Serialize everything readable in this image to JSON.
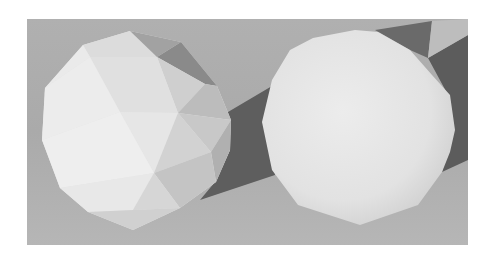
{
  "figure": {
    "left_object": "flat-shaded-sphere",
    "right_object": "smooth-shaded-sphere",
    "colors": {
      "background": "#ffffff",
      "floor": "#a9a9a9",
      "floor_light": "#b3b3b3",
      "shadow": "#5f5f5f",
      "sphere_light": "#e9e9e9",
      "sphere_mid": "#d4d4d4",
      "sphere_dark": "#8e8e8e"
    }
  }
}
